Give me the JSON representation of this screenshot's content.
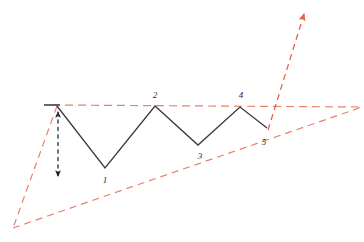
{
  "chart_data": {
    "type": "line",
    "title": "",
    "subtitle": "",
    "xlabel": "",
    "ylabel": "",
    "grid": false,
    "legend": "none",
    "pattern_name": "Rising Wedge / Ascending Broadening Pattern",
    "xlim": [
      0,
      364
    ],
    "ylim": [
      242,
      0
    ],
    "axes_visible": false,
    "tick_labels": [],
    "annotations": [
      {
        "label": "1",
        "x": 105,
        "y": 181
      },
      {
        "label": "2",
        "x": 155,
        "y": 96
      },
      {
        "label": "3",
        "x": 200,
        "y": 157
      },
      {
        "label": "4",
        "x": 241,
        "y": 96
      },
      {
        "label": "5",
        "x": 264,
        "y": 143
      }
    ],
    "series": [
      {
        "name": "price-zigzag",
        "type": "line",
        "style": "solid",
        "color": "#3a3a3a",
        "width": 1.3,
        "points": [
          {
            "label": "start",
            "x": 57,
            "y": 106
          },
          {
            "label": "1",
            "x": 105,
            "y": 168
          },
          {
            "label": "2",
            "x": 155,
            "y": 106
          },
          {
            "label": "3",
            "x": 198,
            "y": 145
          },
          {
            "label": "4",
            "x": 240,
            "y": 107
          },
          {
            "label": "5",
            "x": 267,
            "y": 128
          }
        ]
      },
      {
        "name": "upper-trendline",
        "type": "line",
        "style": "dashed",
        "color": "#e8816a",
        "width": 1.2,
        "points": [
          {
            "x": 52,
            "y": 105
          },
          {
            "x": 362,
            "y": 107
          }
        ]
      },
      {
        "name": "lower-trendline",
        "type": "line",
        "style": "dashed",
        "color": "#e8816a",
        "width": 1.2,
        "points": [
          {
            "x": 13,
            "y": 228
          },
          {
            "x": 362,
            "y": 107
          }
        ]
      },
      {
        "name": "left-apex-line",
        "type": "line",
        "style": "dashed",
        "color": "#e8816a",
        "width": 1.2,
        "points": [
          {
            "x": 57,
            "y": 106
          },
          {
            "x": 13,
            "y": 228
          }
        ]
      },
      {
        "name": "breakout-arrow",
        "type": "arrow",
        "style": "dashed",
        "color": "#e8604a",
        "width": 1.3,
        "points": [
          {
            "x": 268,
            "y": 130
          },
          {
            "x": 305,
            "y": 11
          }
        ],
        "arrowhead": "end"
      },
      {
        "name": "height-measure-arrow",
        "type": "arrow",
        "style": "dashed",
        "color": "#4a5560",
        "width": 1.1,
        "points": [
          {
            "x": 58,
            "y": 107
          },
          {
            "x": 58,
            "y": 181
          }
        ],
        "arrowhead": "both"
      },
      {
        "name": "origin-stub",
        "type": "line",
        "style": "solid",
        "color": "#56565e",
        "width": 1.6,
        "points": [
          {
            "x": 44,
            "y": 105
          },
          {
            "x": 60,
            "y": 105
          }
        ]
      }
    ],
    "colors": {
      "background": "#ffffff",
      "price_line": "#3a3a3a",
      "trendline": "#e8816a",
      "breakout": "#e8604a",
      "measure_arrow": "#4a5560",
      "label_text": "#2b2b2b"
    }
  }
}
